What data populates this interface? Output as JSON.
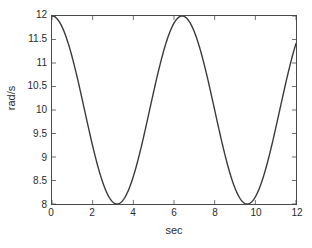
{
  "chart_data": {
    "type": "line",
    "title": "",
    "xlabel": "sec",
    "ylabel": "rad/s",
    "xlim": [
      0,
      12
    ],
    "ylim": [
      8,
      12
    ],
    "grid": false,
    "legend": null,
    "xticks": [
      0,
      2,
      4,
      6,
      8,
      10,
      12
    ],
    "xtick_labels": [
      "0",
      "2",
      "4",
      "6",
      "8",
      "10",
      "12"
    ],
    "yticks": [
      8,
      8.5,
      9,
      9.5,
      10,
      10.5,
      11,
      11.5,
      12
    ],
    "ytick_labels": [
      "8",
      "8.5",
      "9",
      "9.5",
      "10",
      "10.5",
      "11",
      "11.5",
      "12"
    ],
    "line_color": "#3a3a3a",
    "line_width": 1.4,
    "axis_color": "#4a4a4a",
    "series": [
      {
        "name": "angular velocity",
        "formula": "10 + 2*cos(2*pi*t/6.4)",
        "amplitude": 2,
        "offset": 10,
        "period": 6.4,
        "x": [
          0,
          0.25,
          0.5,
          0.75,
          1,
          1.25,
          1.5,
          1.75,
          2,
          2.25,
          2.5,
          2.75,
          3,
          3.2,
          3.4,
          3.6,
          3.8,
          4,
          4.25,
          4.5,
          4.75,
          5,
          5.25,
          5.5,
          5.75,
          6,
          6.2,
          6.4,
          6.6,
          6.8,
          7,
          7.25,
          7.5,
          7.75,
          8,
          8.25,
          8.5,
          8.75,
          9,
          9.25,
          9.5,
          9.6,
          9.8,
          10,
          10.25,
          10.5,
          10.75,
          11,
          11.25,
          11.5,
          11.75,
          12
        ],
        "y": [
          12.0,
          11.94,
          11.76,
          11.47,
          11.08,
          10.62,
          10.12,
          9.61,
          9.12,
          8.68,
          8.33,
          8.1,
          8.0,
          8.0,
          8.04,
          8.19,
          8.44,
          8.77,
          9.25,
          9.77,
          10.28,
          10.76,
          11.2,
          11.56,
          11.82,
          11.96,
          12.0,
          12.0,
          11.94,
          11.81,
          11.61,
          11.28,
          10.88,
          10.43,
          9.94,
          9.45,
          8.99,
          8.58,
          8.26,
          8.06,
          8.0,
          8.0,
          8.06,
          8.18,
          8.41,
          8.7,
          9.05,
          9.44,
          9.86,
          10.3,
          10.74,
          11.15
        ]
      }
    ]
  },
  "axes": {
    "x_label": "sec",
    "y_label": "rad/s"
  }
}
